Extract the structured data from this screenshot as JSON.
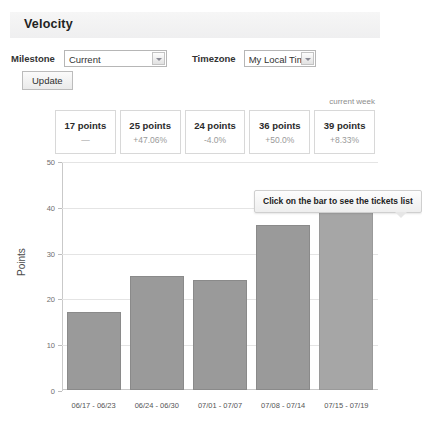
{
  "top_cutoff_text": "· · · · · · · · · ·",
  "header": {
    "title": "Velocity"
  },
  "toolbar": {
    "milestone_label": "Milestone",
    "milestone_value": "Current",
    "timezone_label": "Timezone",
    "timezone_value": "My Local Time",
    "update_label": "Update"
  },
  "summary": {
    "current_week_label": "current week",
    "boxes": [
      {
        "points": "17 points",
        "delta": "—"
      },
      {
        "points": "25 points",
        "delta": "+47.06%"
      },
      {
        "points": "24 points",
        "delta": "-4.0%"
      },
      {
        "points": "36 points",
        "delta": "+50.0%"
      },
      {
        "points": "39 points",
        "delta": "+8.33%"
      }
    ]
  },
  "tooltip": {
    "text": "Click on the bar to see the tickets list"
  },
  "chart_data": {
    "type": "bar",
    "title": "Velocity",
    "xlabel": "",
    "ylabel": "Points",
    "categories": [
      "06/17 - 06/23",
      "06/24 - 06/30",
      "07/01 - 07/07",
      "07/08 - 07/14",
      "07/15 - 07/19"
    ],
    "values": [
      17,
      25,
      24,
      36,
      39
    ],
    "ylim": [
      0,
      50
    ],
    "yticks": [
      0,
      10,
      20,
      30,
      40,
      50
    ],
    "grid": true,
    "legend": null,
    "bar_color": "#9a9a9a",
    "bar_border_color": "#8a8a8a",
    "highlight_index": 4,
    "annotations": [
      "Click on the bar to see the tickets list"
    ]
  }
}
